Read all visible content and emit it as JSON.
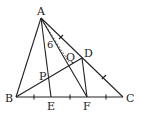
{
  "diagram": {
    "type": "geometry-triangle",
    "points": {
      "A": {
        "label": "A",
        "x": 41,
        "y": 18
      },
      "B": {
        "label": "B",
        "x": 16,
        "y": 97
      },
      "C": {
        "label": "C",
        "x": 123,
        "y": 97
      },
      "D": {
        "label": "D",
        "x": 82,
        "y": 58
      },
      "E": {
        "label": "E",
        "x": 51,
        "y": 97
      },
      "F": {
        "label": "F",
        "x": 87,
        "y": 97
      },
      "P": {
        "label": "P",
        "x": 48,
        "y": 77
      },
      "Q": {
        "label": "Q",
        "x": 70,
        "y": 63
      }
    },
    "segments": [
      [
        "A",
        "B"
      ],
      [
        "B",
        "C"
      ],
      [
        "A",
        "C"
      ],
      [
        "A",
        "E"
      ],
      [
        "A",
        "F"
      ],
      [
        "B",
        "D"
      ],
      [
        "D",
        "F"
      ]
    ],
    "dotted_segments": [
      [
        "A",
        "Q"
      ]
    ],
    "length_label": {
      "text": "6",
      "segment": "AQ"
    },
    "equal_marks": {
      "BC": "divided into four equal parts (B, E, F, C with ticks)",
      "AC": "D is midpoint of AC"
    },
    "stroke_color": "#222222"
  }
}
